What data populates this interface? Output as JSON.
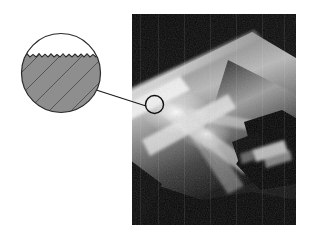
{
  "figure": {
    "kind": "technical-illustration",
    "background_color": "#ffffff",
    "width": 310,
    "height": 239
  },
  "photo": {
    "name": "turning-operation-photograph",
    "subject": "cylindrical workpiece being turned by a cutting tool",
    "frame": {
      "x": 132,
      "y": 14,
      "width": 164,
      "height": 211
    },
    "background_color": "#0b0b0b",
    "workpiece_color": "#7d7d7d",
    "highlight_color": "#f2f2f2",
    "tool_color": "#080808",
    "shoulder_color": "#5a5a5a"
  },
  "callout": {
    "name": "magnified-surface-detail",
    "description": "magnified view of machined surface roughness",
    "circle": {
      "cx": 43,
      "cy": 43,
      "r": 40
    },
    "outline_color": "#2b2b2b",
    "material_fill": "#8e8e8e",
    "void_fill": "#ffffff",
    "hatch_color": "#4a4a4a",
    "profile": {
      "type": "sawtooth-roughness",
      "teeth": 26,
      "amplitude_px": 3,
      "baseline_y": 27
    }
  },
  "leader": {
    "name": "callout-leader-line",
    "color": "#1a1a1a",
    "from": {
      "x": 0,
      "y": 0
    },
    "to": {
      "x": 56,
      "y": 18
    }
  },
  "target": {
    "name": "inspection-target-circle",
    "circle": {
      "cx": 10.5,
      "cy": 10.5,
      "r": 9
    },
    "outline_color": "#111111"
  }
}
